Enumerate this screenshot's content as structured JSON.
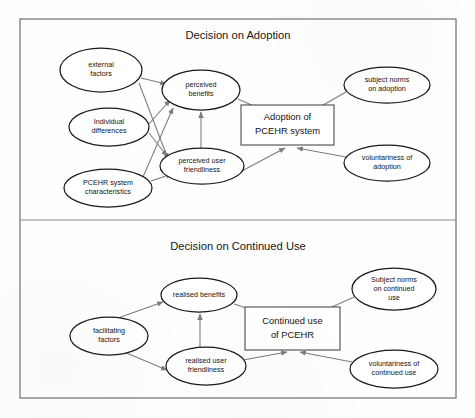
{
  "figure": {
    "frame": {
      "x": 20,
      "y": 19,
      "width": 436,
      "height": 379
    },
    "divider_y": 220,
    "stroke_color": "#6f6f6f",
    "node_stroke_color": "#1a1a1a",
    "edge_color": "#7c7c7c",
    "text_color": "#141414",
    "background": "#ffffff"
  },
  "panels": [
    {
      "id": "adoption",
      "title": "Decision on Adoption",
      "title_pos": {
        "x": 238,
        "y": 36
      }
    },
    {
      "id": "continued-use",
      "title": "Decision on Continued Use",
      "title_pos": {
        "x": 238,
        "y": 247
      }
    }
  ],
  "nodes": [
    {
      "id": "external-factors",
      "panel": "adoption",
      "shape": "ellipse",
      "cx": 101,
      "cy": 70,
      "rx": 41,
      "ry": 22,
      "lines": [
        "external",
        "factors"
      ]
    },
    {
      "id": "individual-differences",
      "panel": "adoption",
      "shape": "ellipse",
      "cx": 109,
      "cy": 127,
      "rx": 40,
      "ry": 19,
      "lines": [
        "Individual",
        "differences"
      ]
    },
    {
      "id": "pcehr-system-characteristics",
      "panel": "adoption",
      "shape": "ellipse",
      "cx": 108,
      "cy": 188,
      "rx": 44,
      "ry": 19,
      "lines": [
        "PCEHR system",
        "characteristics"
      ]
    },
    {
      "id": "perceived-benefits",
      "panel": "adoption",
      "shape": "ellipse",
      "cx": 201,
      "cy": 90,
      "rx": 39,
      "ry": 20,
      "lines": [
        "perceived",
        "benefits"
      ]
    },
    {
      "id": "perceived-user-friendliness",
      "panel": "adoption",
      "shape": "ellipse",
      "cx": 202,
      "cy": 166,
      "rx": 42,
      "ry": 18,
      "lines": [
        "perceived user",
        "friendliness"
      ]
    },
    {
      "id": "adoption-of-pcehr-system",
      "panel": "adoption",
      "shape": "box",
      "x": 241,
      "y": 105,
      "width": 93,
      "height": 40,
      "lines": [
        "Adoption of",
        "PCEHR system"
      ]
    },
    {
      "id": "subject-norms-on-adoption",
      "panel": "adoption",
      "shape": "ellipse",
      "cx": 387,
      "cy": 85,
      "rx": 43,
      "ry": 18,
      "lines": [
        "subject norms",
        "on adoption"
      ]
    },
    {
      "id": "voluntariness-of-adoption",
      "panel": "adoption",
      "shape": "ellipse",
      "cx": 387,
      "cy": 163,
      "rx": 43,
      "ry": 18,
      "lines": [
        "voluntariness of",
        "adoption"
      ]
    },
    {
      "id": "realised-benefits",
      "panel": "continued-use",
      "shape": "ellipse",
      "cx": 199,
      "cy": 295,
      "rx": 38,
      "ry": 17,
      "lines": [
        "realised benefits"
      ]
    },
    {
      "id": "facilitating-factors",
      "panel": "continued-use",
      "shape": "ellipse",
      "cx": 109,
      "cy": 336,
      "rx": 39,
      "ry": 19,
      "lines": [
        "facilitating",
        "factors"
      ]
    },
    {
      "id": "realised-user-friendliness",
      "panel": "continued-use",
      "shape": "ellipse",
      "cx": 206,
      "cy": 366,
      "rx": 40,
      "ry": 19,
      "lines": [
        "realised user",
        "friendliness"
      ]
    },
    {
      "id": "continued-use-of-pcehr",
      "panel": "continued-use",
      "shape": "box",
      "x": 245,
      "y": 307,
      "width": 95,
      "height": 43,
      "lines": [
        "Continued use",
        "of PCEHR"
      ]
    },
    {
      "id": "subject-norms-on-continued-use",
      "panel": "continued-use",
      "shape": "ellipse",
      "cx": 394,
      "cy": 289,
      "rx": 42,
      "ry": 21,
      "lines": [
        "Subject norms",
        "on continued",
        "use"
      ]
    },
    {
      "id": "voluntariness-of-continued-use",
      "panel": "continued-use",
      "shape": "ellipse",
      "cx": 394,
      "cy": 369,
      "rx": 44,
      "ry": 19,
      "lines": [
        "voluntariness of",
        "continued use"
      ]
    }
  ],
  "edges": [
    {
      "id": "external-factors-to-perceived-benefits",
      "from": "external-factors",
      "to": "perceived-benefits",
      "path": "M141,78 L166,84"
    },
    {
      "id": "external-factors-to-perceived-user-friendliness",
      "from": "external-factors",
      "to": "perceived-user-friendliness",
      "path": "M139,83 L168,159"
    },
    {
      "id": "individual-differences-to-perceived-benefits",
      "from": "individual-differences",
      "to": "perceived-benefits",
      "path": "M149,124 L170,100"
    },
    {
      "id": "individual-differences-to-perceived-user-friendliness",
      "from": "individual-differences",
      "to": "perceived-user-friendliness",
      "path": "M149,133 L167,156"
    },
    {
      "id": "pcehr-characteristics-to-perceived-benefits",
      "from": "pcehr-system-characteristics",
      "to": "perceived-benefits",
      "path": "M143,177 L173,108"
    },
    {
      "id": "pcehr-characteristics-to-perceived-user-friendliness",
      "from": "pcehr-system-characteristics",
      "to": "perceived-user-friendliness",
      "path": "M151,181 L172,174"
    },
    {
      "id": "perceived-user-friendliness-to-perceived-benefits",
      "from": "perceived-user-friendliness",
      "to": "perceived-benefits",
      "path": "M201,148 L201,112"
    },
    {
      "id": "perceived-benefits-to-adoption",
      "from": "perceived-benefits",
      "to": "adoption-of-pcehr-system",
      "path": "M238,99 L285,120"
    },
    {
      "id": "perceived-user-friendliness-to-adoption",
      "from": "perceived-user-friendliness",
      "to": "adoption-of-pcehr-system",
      "path": "M240,172 L285,148"
    },
    {
      "id": "subject-norms-to-adoption",
      "from": "subject-norms-on-adoption",
      "to": "adoption-of-pcehr-system",
      "path": "M346,92 L297,120"
    },
    {
      "id": "voluntariness-to-adoption",
      "from": "voluntariness-of-adoption",
      "to": "adoption-of-pcehr-system",
      "path": "M346,157 L297,148"
    },
    {
      "id": "facilitating-factors-to-realised-benefits",
      "from": "facilitating-factors",
      "to": "realised-benefits",
      "path": "M118,318 L163,302"
    },
    {
      "id": "facilitating-factors-to-realised-user-friendliness",
      "from": "facilitating-factors",
      "to": "realised-user-friendliness",
      "path": "M124,352 L167,370"
    },
    {
      "id": "realised-user-friendliness-to-realised-benefits",
      "from": "realised-user-friendliness",
      "to": "realised-benefits",
      "path": "M200,347 L200,314"
    },
    {
      "id": "realised-benefits-to-continued-use",
      "from": "realised-benefits",
      "to": "continued-use-of-pcehr",
      "path": "M234,304 L286,321"
    },
    {
      "id": "realised-user-friendliness-to-continued-use",
      "from": "realised-user-friendliness",
      "to": "continued-use-of-pcehr",
      "path": "M243,360 L287,352"
    },
    {
      "id": "subject-norms-continued-to-continued-use",
      "from": "subject-norms-on-continued-use",
      "to": "continued-use-of-pcehr",
      "path": "M354,297 L301,321"
    },
    {
      "id": "voluntariness-continued-to-continued-use",
      "from": "voluntariness-of-continued-use",
      "to": "continued-use-of-pcehr",
      "path": "M352,362 L300,352"
    }
  ]
}
